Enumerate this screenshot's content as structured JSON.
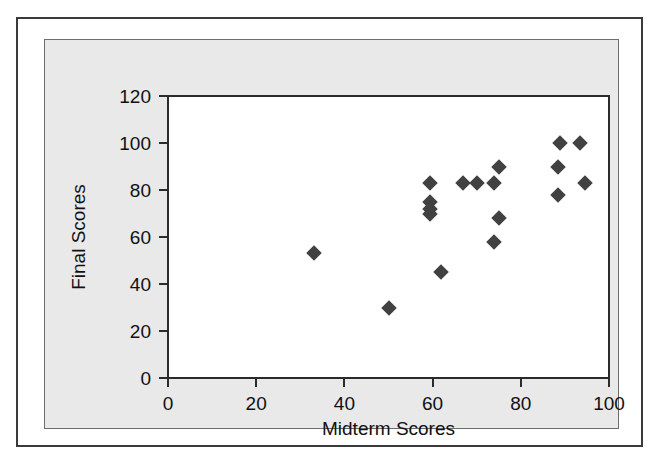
{
  "chart_data": {
    "type": "scatter",
    "title": "",
    "xlabel": "Midterm Scores",
    "ylabel": "Final Scores",
    "xlim": [
      0,
      100
    ],
    "ylim": [
      0,
      120
    ],
    "xticks": [
      0,
      20,
      40,
      60,
      80,
      100
    ],
    "yticks": [
      0,
      20,
      40,
      60,
      80,
      100,
      120
    ],
    "grid": false,
    "legend": null,
    "marker_shape": "diamond",
    "marker_color": "#414141",
    "points": [
      {
        "x": 33,
        "y": 53
      },
      {
        "x": 50,
        "y": 30
      },
      {
        "x": 59.5,
        "y": 83
      },
      {
        "x": 59.5,
        "y": 75
      },
      {
        "x": 59.5,
        "y": 72
      },
      {
        "x": 59.5,
        "y": 70
      },
      {
        "x": 62,
        "y": 45
      },
      {
        "x": 67,
        "y": 83
      },
      {
        "x": 70,
        "y": 83
      },
      {
        "x": 74,
        "y": 83
      },
      {
        "x": 75,
        "y": 90
      },
      {
        "x": 75,
        "y": 68
      },
      {
        "x": 74,
        "y": 58
      },
      {
        "x": 89,
        "y": 100
      },
      {
        "x": 93.5,
        "y": 100
      },
      {
        "x": 88.5,
        "y": 90
      },
      {
        "x": 94.5,
        "y": 83
      },
      {
        "x": 88.5,
        "y": 78
      }
    ]
  }
}
